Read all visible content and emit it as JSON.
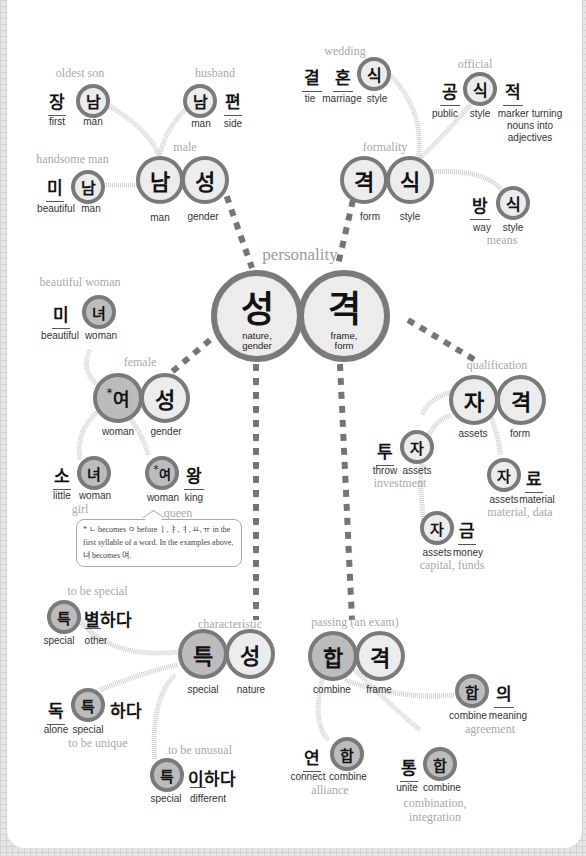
{
  "colors": {
    "circle_border": "#7a7a7a",
    "circle_fill_light": "#ececec",
    "circle_fill_dark": "#bcbcbc",
    "title_text": "#a8a8a8",
    "background_grid": "#e6e6e6",
    "panel": "#ffffff"
  },
  "center": {
    "title": "personality",
    "left": {
      "char": "성",
      "gloss_line1": "nature,",
      "gloss_line2": "gender"
    },
    "right": {
      "char": "격",
      "gloss_line1": "frame,",
      "gloss_line2": "form"
    }
  },
  "male": {
    "title": "male",
    "chars": [
      {
        "char": "남",
        "gloss": "man"
      },
      {
        "char": "성",
        "gloss": "gender"
      }
    ],
    "oldest_son": {
      "title": "oldest son",
      "chars": [
        {
          "char": "장",
          "gloss": "first"
        },
        {
          "char": "남",
          "gloss": "man"
        }
      ]
    },
    "husband": {
      "title": "husband",
      "chars": [
        {
          "char": "남",
          "gloss": "man"
        },
        {
          "char": "편",
          "gloss": "side"
        }
      ]
    },
    "handsome_man": {
      "title": "handsome man",
      "chars": [
        {
          "char": "미",
          "gloss": "beautiful"
        },
        {
          "char": "남",
          "gloss": "man"
        }
      ]
    }
  },
  "formality": {
    "title": "formality",
    "chars": [
      {
        "char": "격",
        "gloss": "form"
      },
      {
        "char": "식",
        "gloss": "style"
      }
    ],
    "wedding": {
      "title": "wedding",
      "chars": [
        {
          "char": "결",
          "gloss": "tie"
        },
        {
          "char": "혼",
          "gloss": "marriage"
        },
        {
          "char": "식",
          "gloss": "style"
        }
      ]
    },
    "official": {
      "title": "official",
      "chars": [
        {
          "char": "공",
          "gloss": "public"
        },
        {
          "char": "식",
          "gloss": "style"
        },
        {
          "char": "적",
          "gloss_line1": "marker turning",
          "gloss_line2": "nouns into",
          "gloss_line3": "adjectives"
        }
      ]
    },
    "means": {
      "title": "means",
      "chars": [
        {
          "char": "방",
          "gloss": "way"
        },
        {
          "char": "식",
          "gloss": "style"
        }
      ]
    }
  },
  "female": {
    "title": "female",
    "chars": [
      {
        "char": "여",
        "star": "*",
        "gloss": "woman"
      },
      {
        "char": "성",
        "gloss": "gender"
      }
    ],
    "beautiful_woman": {
      "title": "beautiful woman",
      "chars": [
        {
          "char": "미",
          "gloss": "beautiful"
        },
        {
          "char": "녀",
          "gloss": "woman"
        }
      ]
    },
    "girl": {
      "title": "girl",
      "chars": [
        {
          "char": "소",
          "gloss": "little"
        },
        {
          "char": "녀",
          "gloss": "woman"
        }
      ]
    },
    "queen": {
      "title": "queen",
      "chars": [
        {
          "char": "여",
          "star": "*",
          "gloss": "woman"
        },
        {
          "char": "왕",
          "gloss": "king"
        }
      ]
    },
    "note": "* ㄴ becomes ㅇ before ㅣ, ㅑ, ㅕ, ㅛ, ㅠ in the first syllable of a word. In the examples above, 녀 becomes 여."
  },
  "qualification": {
    "title": "qualification",
    "chars": [
      {
        "char": "자",
        "gloss": "assets"
      },
      {
        "char": "격",
        "gloss": "form"
      }
    ],
    "investment": {
      "title": "investment",
      "chars": [
        {
          "char": "투",
          "gloss": "throw"
        },
        {
          "char": "자",
          "gloss": "assets"
        }
      ]
    },
    "material": {
      "title": "material, data",
      "chars": [
        {
          "char": "자",
          "gloss": "assets"
        },
        {
          "char": "료",
          "gloss": "material"
        }
      ]
    },
    "capital": {
      "title": "capital, funds",
      "chars": [
        {
          "char": "자",
          "gloss": "assets"
        },
        {
          "char": "금",
          "gloss": "money"
        }
      ]
    }
  },
  "characteristic": {
    "title": "characteristic",
    "chars": [
      {
        "char": "특",
        "gloss": "special"
      },
      {
        "char": "성",
        "gloss": "nature"
      }
    ],
    "to_be_special": {
      "title": "to be special",
      "chars": [
        {
          "char": "특",
          "gloss": "special"
        },
        {
          "char": "별하다",
          "gloss": "other"
        }
      ]
    },
    "to_be_unique": {
      "title": "to be unique",
      "chars": [
        {
          "char": "독",
          "gloss": "alone"
        },
        {
          "char": "특",
          "gloss": "special"
        },
        {
          "char": "하다"
        }
      ]
    },
    "to_be_unusual": {
      "title": "to be unusual",
      "chars": [
        {
          "char": "특",
          "gloss": "special"
        },
        {
          "char": "이하다",
          "gloss": "different"
        }
      ]
    }
  },
  "passing": {
    "title": "passing (an exam)",
    "chars": [
      {
        "char": "합",
        "gloss": "combine"
      },
      {
        "char": "격",
        "gloss": "frame"
      }
    ],
    "agreement": {
      "title": "agreement",
      "chars": [
        {
          "char": "합",
          "gloss": "combine"
        },
        {
          "char": "의",
          "gloss": "meaning"
        }
      ]
    },
    "alliance": {
      "title": "alliance",
      "chars": [
        {
          "char": "연",
          "gloss": "connect"
        },
        {
          "char": "합",
          "gloss": "combine"
        }
      ]
    },
    "combination": {
      "title_line1": "combination,",
      "title_line2": "integration",
      "chars": [
        {
          "char": "통",
          "gloss": "unite"
        },
        {
          "char": "합",
          "gloss": "combine"
        }
      ]
    }
  }
}
